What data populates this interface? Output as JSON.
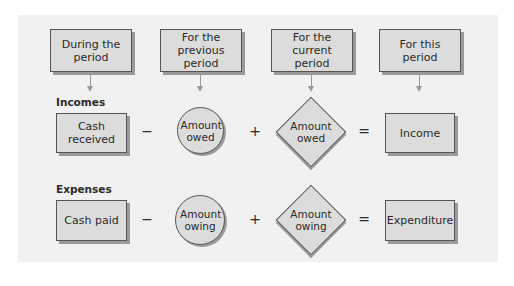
{
  "headers": [
    {
      "label": "During the period"
    },
    {
      "label": "For the previous period"
    },
    {
      "label": "For the current period"
    },
    {
      "label": "For this period"
    }
  ],
  "rows": [
    {
      "title": "Incomes",
      "term1": "Cash received",
      "op1": "−",
      "term2": "Amount owed",
      "op2": "+",
      "term3": "Amount owed",
      "op3": "=",
      "result": "Income"
    },
    {
      "title": "Expenses",
      "term1": "Cash paid",
      "op1": "−",
      "term2": "Amount owing",
      "op2": "+",
      "term3": "Amount owing",
      "op3": "=",
      "result": "Expenditure"
    }
  ]
}
